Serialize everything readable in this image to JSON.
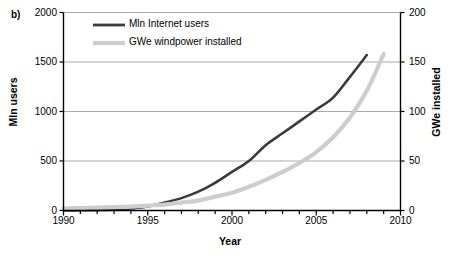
{
  "panel": {
    "label": "b)"
  },
  "chart_data": {
    "type": "line",
    "title": "",
    "subtitle": "",
    "xlabel": "Year",
    "ylabel": "Mln users",
    "ylabel_secondary": "GWe installed",
    "xlim": [
      1990,
      2010
    ],
    "ylim": [
      0,
      2000
    ],
    "ylim_secondary": [
      0,
      200
    ],
    "xticks": [
      1990,
      1995,
      2000,
      2005,
      2010
    ],
    "xtick_labels": [
      "1990",
      "1995",
      "2000",
      "2005",
      "2010"
    ],
    "xtick_minor_step": 1,
    "yticks": [
      0,
      500,
      1000,
      1500,
      2000
    ],
    "ytick_labels": [
      "0",
      "500",
      "1000",
      "1500",
      "2000"
    ],
    "yticks_secondary": [
      0,
      50,
      100,
      150,
      200
    ],
    "ytick_labels_secondary": [
      "0",
      "50",
      "100",
      "150",
      "200"
    ],
    "grid": "horizontal",
    "legend_position": "top-left-inside",
    "series": [
      {
        "name": "Mln Internet users",
        "axis": "left",
        "color": "#3b3b3b",
        "width": 2.6,
        "x": [
          1990,
          1991,
          1992,
          1993,
          1994,
          1995,
          1996,
          1997,
          1998,
          1999,
          2000,
          2001,
          2002,
          2003,
          2004,
          2005,
          2006,
          2007,
          2008
        ],
        "values": [
          1,
          2,
          4,
          8,
          20,
          40,
          80,
          125,
          190,
          280,
          390,
          500,
          660,
          780,
          900,
          1020,
          1140,
          1350,
          1570
        ]
      },
      {
        "name": "GWe windpower installed",
        "axis": "right",
        "color": "#cdcdcd",
        "width": 4.2,
        "x": [
          1990,
          1991,
          1992,
          1993,
          1994,
          1995,
          1996,
          1997,
          1998,
          1999,
          2000,
          2001,
          2002,
          2003,
          2004,
          2005,
          2006,
          2007,
          2008,
          2009
        ],
        "values": [
          2,
          2.5,
          3,
          3.5,
          4,
          5,
          6,
          8,
          10,
          14,
          18,
          24,
          31,
          39,
          48,
          59,
          74,
          94,
          121,
          158
        ]
      }
    ],
    "legend": [
      {
        "label": "Mln Internet users",
        "color": "#3b3b3b"
      },
      {
        "label": "GWe windpower installed",
        "color": "#cdcdcd"
      }
    ],
    "colors": {
      "axis": "#000000",
      "grid": "#a9a9a9",
      "background": "#ffffff",
      "internet_users_line": "#3b3b3b",
      "windpower_line": "#cdcdcd"
    }
  }
}
